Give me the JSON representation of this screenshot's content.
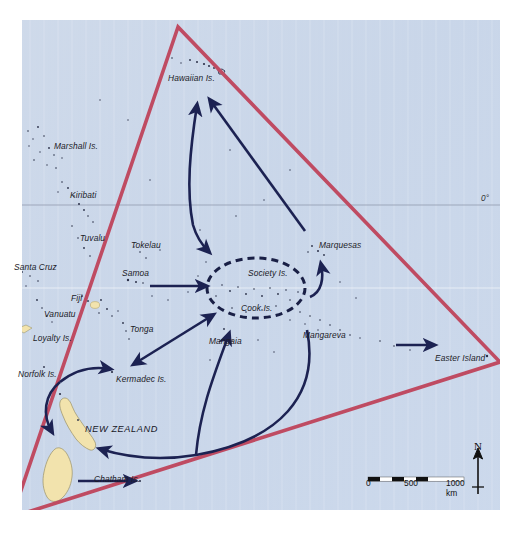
{
  "map": {
    "title": "Polynesian Triangle migration map",
    "background_color": "#ffffff",
    "ocean_color": "#ccd8ea",
    "land_color": "#f2e3ad",
    "triangle_color": "#bf4b62",
    "arrow_color": "#1c2252",
    "graticule_color": "#8d94a8",
    "equator_label": "0°"
  },
  "labels": {
    "islands": [
      {
        "name": "Hawaiian Is.",
        "text": "Hawaiian Is.",
        "x": 168,
        "y": 73
      },
      {
        "name": "Marshall Is.",
        "text": "Marshall Is.",
        "x": 54,
        "y": 141
      },
      {
        "name": "Kiribati",
        "text": "Kiribati",
        "x": 70,
        "y": 190
      },
      {
        "name": "Tuvalu",
        "text": "Tuvalu",
        "x": 80,
        "y": 233
      },
      {
        "name": "Tokelau",
        "text": "Tokelau",
        "x": 131,
        "y": 240
      },
      {
        "name": "Santa Cruz",
        "text": "Santa Cruz",
        "x": 14,
        "y": 262
      },
      {
        "name": "Samoa",
        "text": "Samoa",
        "x": 122,
        "y": 268
      },
      {
        "name": "Society Is.",
        "text": "Society Is.",
        "x": 248,
        "y": 268
      },
      {
        "name": "Marquesas",
        "text": "Marquesas",
        "x": 319,
        "y": 240
      },
      {
        "name": "Fiji",
        "text": "Fiji",
        "x": 71,
        "y": 293
      },
      {
        "name": "Cook Is.",
        "text": "Cook Is.",
        "x": 241,
        "y": 303
      },
      {
        "name": "Vanuatu",
        "text": "Vanuatu",
        "x": 44,
        "y": 309
      },
      {
        "name": "Tonga",
        "text": "Tonga",
        "x": 130,
        "y": 324
      },
      {
        "name": "Mangaia",
        "text": "Mangaia",
        "x": 209,
        "y": 336
      },
      {
        "name": "Mangareva",
        "text": "Mangareva",
        "x": 303,
        "y": 330
      },
      {
        "name": "Loyalty Is.",
        "text": "Loyalty Is.",
        "x": 33,
        "y": 333
      },
      {
        "name": "Easter Island",
        "text": "Easter Island",
        "x": 435,
        "y": 353
      },
      {
        "name": "Norfolk Is.",
        "text": "Norfolk Is.",
        "x": 18,
        "y": 369
      },
      {
        "name": "Kermadec Is.",
        "text": "Kermadec Is.",
        "x": 116,
        "y": 374
      },
      {
        "name": "Chatham Is.",
        "text": "Chatham Is.",
        "x": 94,
        "y": 474
      }
    ],
    "countries": [
      {
        "name": "New Zealand",
        "text": "NEW ZEALAND",
        "x": 85,
        "y": 424
      }
    ]
  },
  "scale": {
    "name": "scale-bar",
    "unit_label": "1000 km",
    "ticks": [
      "0",
      "500",
      "1000 km"
    ]
  },
  "compass": {
    "name": "compass-rose",
    "north_label": "N"
  }
}
